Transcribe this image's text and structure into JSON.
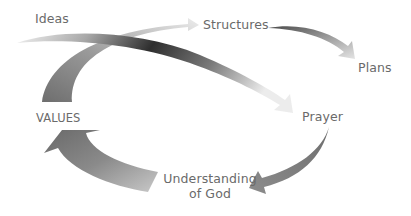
{
  "diagram": {
    "type": "cycle",
    "nodes": [
      {
        "id": "ideas",
        "label": "Ideas"
      },
      {
        "id": "structures",
        "label": "Structures"
      },
      {
        "id": "plans",
        "label": "Plans"
      },
      {
        "id": "prayer",
        "label": "Prayer"
      },
      {
        "id": "understanding",
        "label_line1": "Understanding",
        "label_line2": "of God"
      },
      {
        "id": "values",
        "label": "VALUES"
      }
    ],
    "edges": [
      {
        "from": "Ideas",
        "to": "Prayer",
        "style": "gradient light-to-dark-to-light"
      },
      {
        "from": "VALUES",
        "to": "Structures",
        "style": "gradient dark-to-light"
      },
      {
        "from": "Structures",
        "to": "Plans",
        "style": "gradient dark-to-light"
      },
      {
        "from": "Prayer",
        "to": "Understanding of God",
        "style": "gray"
      },
      {
        "from": "Understanding of God",
        "to": "VALUES",
        "style": "gradient light-to-dark"
      }
    ],
    "colors": {
      "text": "#6a6a6a",
      "arrow_dark": "#333333",
      "arrow_mid": "#888888",
      "arrow_light": "#e6e6e6"
    }
  }
}
